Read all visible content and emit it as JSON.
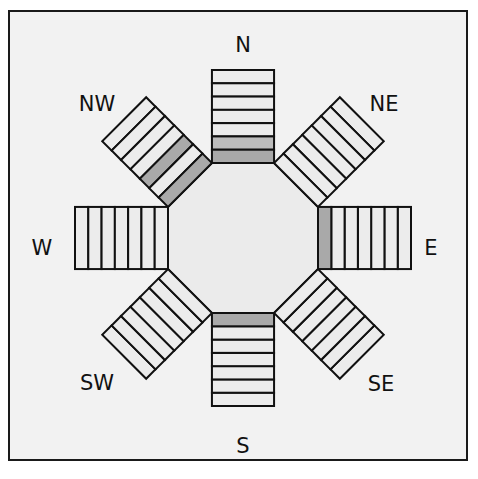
{
  "diagram": {
    "center": [
      243,
      238
    ],
    "octagon_half_width": 75,
    "bar_width": 64,
    "bar_length": 93,
    "segments_per_bar": 7,
    "colors": {
      "frame_border": "#1a1a1a",
      "background": "#f2f2f2",
      "segment_fill": "#ececec",
      "segment_shaded": "#a9a9a9",
      "segment_shaded_light": "#bdbdbd",
      "octagon_fill": "#ebebeb",
      "stroke": "#111111"
    },
    "bars": [
      {
        "direction": "N",
        "angle": 0,
        "label": "N",
        "label_pos": [
          243,
          45
        ],
        "shaded": [
          6,
          7
        ]
      },
      {
        "direction": "NE",
        "angle": 45,
        "label": "NE",
        "label_pos": [
          384,
          104
        ],
        "shaded": []
      },
      {
        "direction": "E",
        "angle": 90,
        "label": "E",
        "label_pos": [
          431,
          248
        ],
        "shaded": [
          7
        ]
      },
      {
        "direction": "SE",
        "angle": 135,
        "label": "SE",
        "label_pos": [
          381,
          384
        ],
        "shaded": []
      },
      {
        "direction": "S",
        "angle": 180,
        "label": "S",
        "label_pos": [
          243,
          446
        ],
        "shaded": [
          7
        ]
      },
      {
        "direction": "SW",
        "angle": 225,
        "label": "SW",
        "label_pos": [
          97,
          383
        ],
        "shaded": []
      },
      {
        "direction": "W",
        "angle": 270,
        "label": "W",
        "label_pos": [
          42,
          248
        ],
        "shaded": []
      },
      {
        "direction": "NW",
        "angle": 315,
        "label": "NW",
        "label_pos": [
          97,
          104
        ],
        "shaded": [
          5,
          7
        ]
      }
    ]
  }
}
